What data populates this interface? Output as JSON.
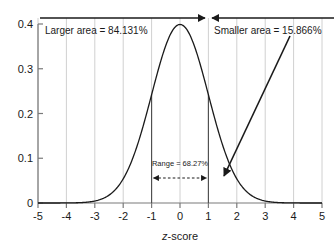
{
  "chart_data": {
    "type": "line",
    "title": "",
    "xlabel": "z-score",
    "ylabel": "",
    "xlim": [
      -5,
      5
    ],
    "ylim": [
      0,
      0.4
    ],
    "grid": "vertical",
    "legend": "none",
    "curve": {
      "name": "standard normal density",
      "formula": "phi(z) = (1/sqrt(2*pi)) * exp(-z^2/2)",
      "mean": 0,
      "sd": 1,
      "peak_value": 0.3989
    },
    "x_ticks": [
      "-5",
      "-4",
      "-3",
      "-2",
      "-1",
      "0",
      "1",
      "2",
      "3",
      "4",
      "5"
    ],
    "x_tick_values": [
      -5,
      -4,
      -3,
      -2,
      -1,
      0,
      1,
      2,
      3,
      4,
      5
    ],
    "y_ticks": [
      "0",
      "0.1",
      "0.2",
      "0.3",
      "0.4"
    ],
    "y_tick_values": [
      0,
      0.1,
      0.2,
      0.3,
      0.4
    ],
    "series": [
      {
        "name": "standard normal density",
        "x": [
          -5,
          -4.5,
          -4,
          -3.5,
          -3,
          -2.5,
          -2,
          -1.5,
          -1,
          -0.5,
          0,
          0.5,
          1,
          1.5,
          2,
          2.5,
          3,
          3.5,
          4,
          4.5,
          5
        ],
        "values": [
          1.5e-06,
          1.6e-05,
          0.0001338,
          0.0008727,
          0.0044318,
          0.0175283,
          0.053991,
          0.1295176,
          0.2419707,
          0.3520653,
          0.3989423,
          0.3520653,
          0.2419707,
          0.1295176,
          0.053991,
          0.0175283,
          0.0044318,
          0.0008727,
          0.0001338,
          1.6e-05,
          1.5e-06
        ]
      }
    ],
    "boundaries": [
      {
        "name": "lower-bound",
        "z": -1,
        "density": 0.2419707
      },
      {
        "name": "upper-bound",
        "z": 1,
        "density": 0.2419707
      }
    ],
    "annotations": [
      {
        "name": "larger-area",
        "text": "Larger area = 84.131%",
        "value": 84.131,
        "units": "%",
        "span_from": -5,
        "span_to": 1,
        "arrow": "right"
      },
      {
        "name": "smaller-area",
        "text": "Smaller area = 15.866%",
        "value": 15.866,
        "units": "%",
        "span_from": 1,
        "span_to": 5,
        "arrow": "left",
        "points_to_z": 1.4
      },
      {
        "name": "range",
        "text": "Range = 68.27%",
        "value": 68.27,
        "units": "%",
        "span_from": -1,
        "span_to": 1,
        "arrow": "both",
        "style": "dashed"
      }
    ],
    "colors": {
      "background": "#ffffff",
      "curve": "#1a1a1a",
      "gridline": "#d0d0d0",
      "axis": "#7a7a7a",
      "annotation": "#1a1a1a",
      "boundary_rule": "#4a4a4a"
    }
  },
  "axes": {
    "x_label_prefix": "z",
    "x_label_suffix": "-score",
    "x_ticks": [
      "-5",
      "-4",
      "-3",
      "-2",
      "-1",
      "0",
      "1",
      "2",
      "3",
      "4",
      "5"
    ],
    "y_ticks": [
      "0.4",
      "0.3",
      "0.2",
      "0.1",
      "0"
    ]
  },
  "annotations": {
    "larger_area": "Larger area = 84.131%",
    "smaller_area": "Smaller area = 15.866%",
    "range": "Range = 68.27%"
  }
}
